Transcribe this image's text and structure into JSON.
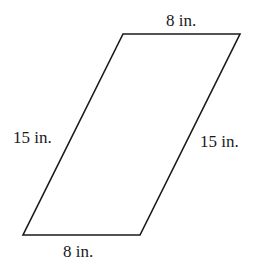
{
  "diagram": {
    "shape": "parallelogram",
    "stroke_color": "#1a1a1a",
    "vertices": {
      "top_left": [
        123,
        34
      ],
      "top_right": [
        240,
        34
      ],
      "bottom_right": [
        140,
        235
      ],
      "bottom_left": [
        23,
        235
      ]
    },
    "labels": {
      "top": "8 in.",
      "bottom": "8 in.",
      "left": "15 in.",
      "right": "15 in."
    }
  }
}
